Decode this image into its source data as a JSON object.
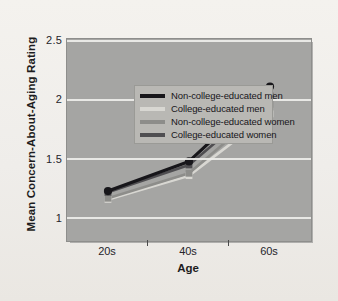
{
  "chart_data": {
    "type": "line",
    "title": "",
    "xlabel": "Age",
    "ylabel": "Mean Concern-About-Aging Rating",
    "categories": [
      "20s",
      "40s",
      "60s"
    ],
    "ylim": [
      0.8,
      2.5
    ],
    "yticks": [
      "1",
      "1.5",
      "2",
      "2.5"
    ],
    "ytick_values": [
      1,
      1.5,
      2,
      2.5
    ],
    "grid": true,
    "legend_position": "top-left",
    "series": [
      {
        "name": "Non-college-educated men",
        "color": "#17161a",
        "marker": "circle",
        "values": [
          1.22,
          1.47,
          2.1
        ]
      },
      {
        "name": "College-educated men",
        "color": "#d8d7d2",
        "marker": "square",
        "values": [
          1.15,
          1.35,
          1.87
        ]
      },
      {
        "name": "Non-college-educated women",
        "color": "#8d8d8a",
        "marker": "square",
        "values": [
          1.16,
          1.37,
          1.95
        ]
      },
      {
        "name": "College-educated women",
        "color": "#4f4e51",
        "marker": "square",
        "values": [
          1.21,
          1.44,
          2.02
        ]
      }
    ]
  },
  "axis": {
    "y_title": "Mean Concern-About-Aging Rating",
    "x_title": "Age",
    "y_ticks": [
      "2.5",
      "2",
      "1.5",
      "1"
    ],
    "x_ticks": [
      "20s",
      "40s",
      "60s"
    ]
  },
  "legend": {
    "items": [
      {
        "label": "Non-college-educated men",
        "color": "#17161a"
      },
      {
        "label": "College-educated men",
        "color": "#d8d7d2"
      },
      {
        "label": "Non-college-educated women",
        "color": "#8d8d8a"
      },
      {
        "label": "College-educated women",
        "color": "#4f4e51"
      }
    ]
  }
}
